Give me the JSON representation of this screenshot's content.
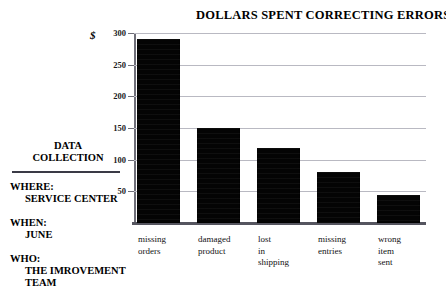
{
  "chart_data": {
    "type": "bar",
    "title": "DOLLARS SPENT CORRECTING ERRORS",
    "xlabel": "",
    "ylabel": "$",
    "categories": [
      "missing orders",
      "damaged product",
      "lost in shipping",
      "missing entries",
      "wrong item sent"
    ],
    "category_lines": [
      [
        "missing",
        "orders"
      ],
      [
        "damaged",
        "product"
      ],
      [
        "lost",
        "in",
        "shipping"
      ],
      [
        "missing",
        "entries"
      ],
      [
        "wrong",
        "item",
        "sent"
      ]
    ],
    "values": [
      290,
      150,
      118,
      80,
      45
    ],
    "ylim": [
      0,
      300
    ],
    "yticks": [
      300,
      250,
      200,
      150,
      100,
      50
    ],
    "ytick_labels": [
      "300",
      "250",
      "200",
      "150",
      "100",
      "50"
    ],
    "grid": true,
    "legend": "none",
    "bar_color": "#040404",
    "grid_color": "#b9b9c2",
    "axis_color": "#6e6e78"
  },
  "annotation": {
    "heading_line1": "DATA",
    "heading_line2": "COLLECTION",
    "groups": [
      {
        "label": "WHERE:",
        "value": "SERVICE CENTER"
      },
      {
        "label": "WHEN:",
        "value": "JUNE"
      },
      {
        "label": "WHO:",
        "value": "THE IMROVEMENT",
        "value2": "TEAM"
      }
    ]
  }
}
